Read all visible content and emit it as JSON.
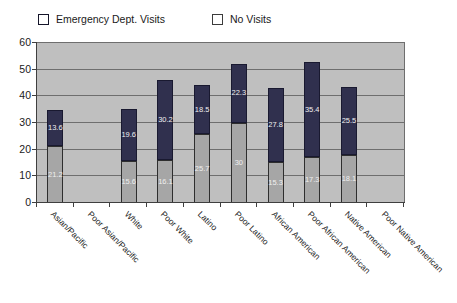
{
  "chart_data": {
    "type": "bar",
    "stacked": true,
    "title": "",
    "legend_position": "top",
    "grid": true,
    "data_labels": true,
    "plot_bg": "#bfbfbf",
    "ylim": [
      0,
      60
    ],
    "yticks": [
      0,
      10,
      20,
      30,
      40,
      50,
      60
    ],
    "categories": [
      "Asian/Pacific",
      "Poor Asian/Pacific",
      "White",
      "Poor White",
      "Latino",
      "Poor Latino",
      "African American",
      "Poor African American",
      "Native American",
      "Poor Native American"
    ],
    "series": [
      {
        "name": "No Visits",
        "color": "#a6a6a6",
        "values": [
          21.2,
          null,
          15.6,
          16.1,
          25.7,
          30,
          15.3,
          17.3,
          18.1,
          null
        ]
      },
      {
        "name": "Emergency Dept. Visits",
        "color": "#30304e",
        "values": [
          13.6,
          null,
          19.6,
          30.2,
          18.5,
          22.3,
          27.8,
          35.4,
          25.5,
          null
        ]
      }
    ]
  }
}
